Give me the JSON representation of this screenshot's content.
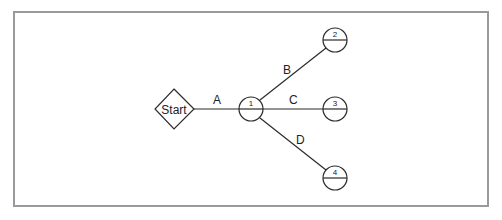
{
  "diagram": {
    "type": "network-diagram",
    "colors": {
      "stroke": "#2b2b2b",
      "frame": "#9a9a9a",
      "background": "#ffffff"
    },
    "start": {
      "label": "Start",
      "shape": "diamond"
    },
    "nodes": [
      {
        "id": "1",
        "label": "1"
      },
      {
        "id": "2",
        "label": "2"
      },
      {
        "id": "3",
        "label": "3"
      },
      {
        "id": "4",
        "label": "4"
      }
    ],
    "edges": [
      {
        "label": "A",
        "from": "Start",
        "to": "1"
      },
      {
        "label": "B",
        "from": "1",
        "to": "2"
      },
      {
        "label": "C",
        "from": "1",
        "to": "3"
      },
      {
        "label": "D",
        "from": "1",
        "to": "4"
      }
    ]
  }
}
